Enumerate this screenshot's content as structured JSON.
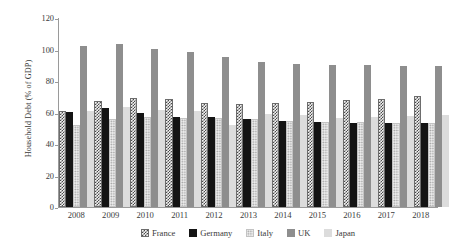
{
  "chart_data": {
    "type": "bar",
    "title": "",
    "xlabel": "",
    "ylabel": "Household Debt (% of GDP)",
    "ylim": [
      0,
      120
    ],
    "yticks": [
      0,
      20,
      40,
      60,
      80,
      100,
      120
    ],
    "grid": false,
    "legend_position": "bottom",
    "categories": [
      "2008",
      "2009",
      "2010",
      "2011",
      "2012",
      "2013",
      "2014",
      "2015",
      "2016",
      "2017",
      "2018"
    ],
    "series": [
      {
        "name": "France",
        "color": "#4a4a4a",
        "pattern": "checkerboard",
        "values": [
          59.5,
          66.0,
          68.0,
          67.5,
          64.5,
          64.0,
          64.5,
          65.5,
          66.5,
          67.5,
          69.0
        ]
      },
      {
        "name": "Germany",
        "color": "#141414",
        "pattern": "solid-dark",
        "values": [
          59.0,
          61.5,
          58.5,
          56.0,
          56.0,
          54.5,
          53.5,
          52.5,
          52.0,
          52.0,
          52.0
        ]
      },
      {
        "name": "Italy",
        "color": "#ebebeb",
        "pattern": "dotted-light",
        "values": [
          50.5,
          54.5,
          56.0,
          55.5,
          55.0,
          54.5,
          53.5,
          53.0,
          52.5,
          52.0,
          52.0
        ]
      },
      {
        "name": "UK",
        "color": "#8e8e8e",
        "pattern": "solid-gray",
        "values": [
          101.0,
          102.5,
          99.0,
          97.0,
          94.0,
          91.0,
          89.5,
          89.0,
          89.0,
          88.5,
          88.5
        ]
      },
      {
        "name": "Japan",
        "color": "#dcdcdc",
        "pattern": "solid-light",
        "values": [
          59.5,
          62.0,
          60.5,
          59.5,
          51.0,
          57.5,
          57.0,
          55.5,
          56.0,
          56.5,
          57.0
        ]
      }
    ]
  }
}
